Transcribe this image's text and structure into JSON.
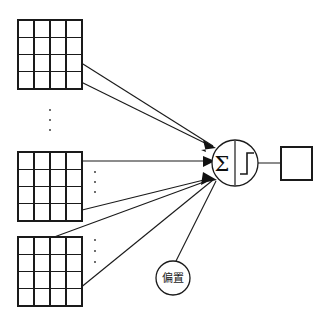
{
  "diagram": {
    "background_color": "#ffffff",
    "stroke_color": "#1a1a1a",
    "width": 329,
    "height": 320,
    "inputs": [
      {
        "id": "input-matrix-top",
        "label": "",
        "rows": 4,
        "cols": 4,
        "x": 18,
        "y": 20,
        "w": 64,
        "h": 69
      },
      {
        "id": "input-matrix-middle",
        "label": "",
        "rows": 4,
        "cols": 4,
        "x": 18,
        "y": 152,
        "w": 64,
        "h": 69
      },
      {
        "id": "input-matrix-bottom",
        "label": "",
        "rows": 4,
        "cols": 4,
        "x": 18,
        "y": 237,
        "w": 64,
        "h": 69
      }
    ],
    "neuron": {
      "id": "summation-activation-node",
      "sum_symbol": "Σ",
      "activation_symbol": "step-function",
      "cx": 235,
      "cy": 163,
      "r": 23
    },
    "bias": {
      "id": "bias-node",
      "label": "偏置",
      "cx": 173,
      "cy": 278,
      "r": 17
    },
    "output": {
      "id": "output-box",
      "label": "",
      "x": 281,
      "y": 147,
      "w": 31,
      "h": 33
    },
    "ellipsis_groups": [
      {
        "id": "ellipsis-between-top-and-middle",
        "cx": 50,
        "cy": 120,
        "count": 3
      },
      {
        "id": "ellipsis-right-of-middle",
        "cx": 95,
        "cy": 182,
        "count": 3
      },
      {
        "id": "ellipsis-right-of-bottom",
        "cx": 95,
        "cy": 251,
        "count": 3
      }
    ],
    "connections": [
      {
        "id": "conn-top-a",
        "from": "input-matrix-top",
        "to": "summation-activation-node"
      },
      {
        "id": "conn-top-b",
        "from": "input-matrix-top",
        "to": "summation-activation-node"
      },
      {
        "id": "conn-middle-a",
        "from": "input-matrix-middle",
        "to": "summation-activation-node"
      },
      {
        "id": "conn-middle-b",
        "from": "input-matrix-middle",
        "to": "summation-activation-node"
      },
      {
        "id": "conn-bottom-a",
        "from": "input-matrix-bottom",
        "to": "summation-activation-node"
      },
      {
        "id": "conn-bottom-b",
        "from": "input-matrix-bottom",
        "to": "summation-activation-node"
      },
      {
        "id": "conn-bias",
        "from": "bias-node",
        "to": "summation-activation-node"
      },
      {
        "id": "conn-output",
        "from": "summation-activation-node",
        "to": "output-box"
      }
    ]
  }
}
